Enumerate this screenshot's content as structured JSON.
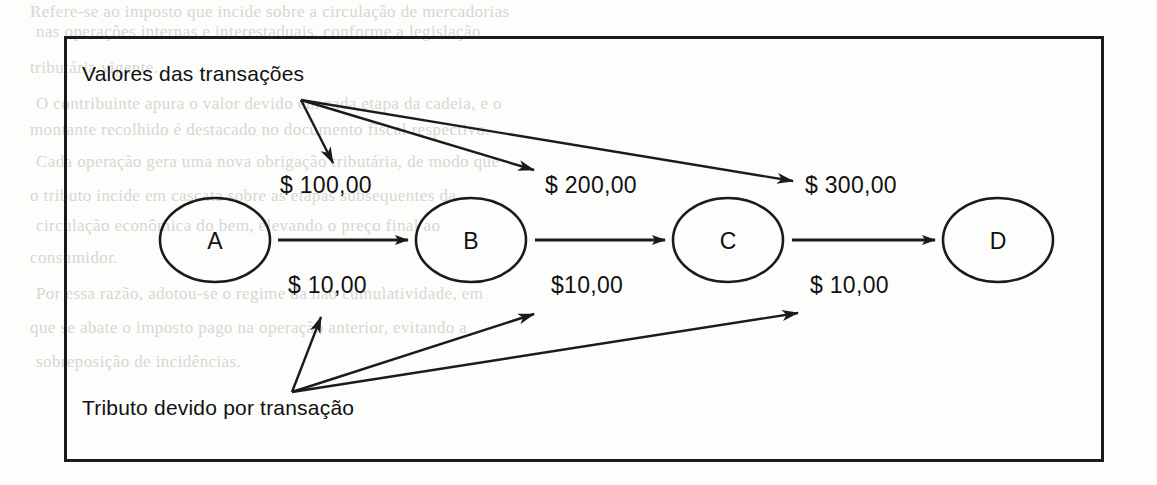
{
  "figure": {
    "captions": {
      "top": "Valores das transações",
      "bottom": "Tributo devido por transação"
    },
    "nodes": [
      {
        "id": "A",
        "label": "A",
        "cx": 215,
        "cy": 240,
        "rx": 55,
        "ry": 42
      },
      {
        "id": "B",
        "label": "B",
        "cx": 471,
        "cy": 240,
        "rx": 55,
        "ry": 42
      },
      {
        "id": "C",
        "label": "C",
        "cx": 728,
        "cy": 240,
        "rx": 55,
        "ry": 42
      },
      {
        "id": "D",
        "label": "D",
        "cx": 998,
        "cy": 240,
        "rx": 55,
        "ry": 42
      }
    ],
    "edges": [
      {
        "from": "A",
        "to": "B",
        "transaction_value": "$ 100,00",
        "tax_value": "$ 10,00"
      },
      {
        "from": "B",
        "to": "C",
        "transaction_value": "$ 200,00",
        "tax_value": "$10,00"
      },
      {
        "from": "C",
        "to": "D",
        "transaction_value": "$ 300,00",
        "tax_value": "$ 10,00"
      }
    ],
    "labels": {
      "transaction_values": [
        {
          "text": "$ 100,00",
          "x": 280,
          "y": 172
        },
        {
          "text": "$ 200,00",
          "x": 545,
          "y": 172
        },
        {
          "text": "$ 300,00",
          "x": 805,
          "y": 172
        }
      ],
      "tax_values": [
        {
          "text": "$ 10,00",
          "x": 288,
          "y": 272
        },
        {
          "text": "$10,00",
          "x": 551,
          "y": 272
        },
        {
          "text": "$ 10,00",
          "x": 810,
          "y": 272
        }
      ]
    },
    "pointer_origins": {
      "top": {
        "x": 301,
        "y": 100
      },
      "bottom": {
        "x": 292,
        "y": 392
      }
    },
    "colors": {
      "ink": "#1b1b1b",
      "paper": "#fdfdfc",
      "bleed_text": "#d9d6d1"
    }
  },
  "bleed_lines": [
    {
      "text": "Refere-se ao imposto que incide sobre a circulação de mercadorias",
      "x": 30,
      "y": 2
    },
    {
      "text": "nas operações internas e interestaduais, conforme a legislação",
      "x": 36,
      "y": 22
    },
    {
      "text": "tributária vigente.",
      "x": 30,
      "y": 58
    },
    {
      "text": "O contribuinte apura o valor devido em cada etapa da cadeia, e o",
      "x": 36,
      "y": 94
    },
    {
      "text": "montante recolhido é destacado no documento fiscal respectivo.",
      "x": 30,
      "y": 120
    },
    {
      "text": "Cada operação gera uma nova obrigação tributária, de modo que",
      "x": 36,
      "y": 152
    },
    {
      "text": "o tributo incide em cascata sobre as etapas subsequentes da",
      "x": 30,
      "y": 186
    },
    {
      "text": "circulação econômica do bem, elevando o preço final ao",
      "x": 36,
      "y": 216
    },
    {
      "text": "consumidor.",
      "x": 30,
      "y": 248
    },
    {
      "text": "Por essa razão, adotou-se o regime da não cumulatividade, em",
      "x": 36,
      "y": 284
    },
    {
      "text": "que se abate o imposto pago na operação anterior, evitando a",
      "x": 30,
      "y": 318
    },
    {
      "text": "sobreposição de incidências.",
      "x": 36,
      "y": 352
    }
  ]
}
